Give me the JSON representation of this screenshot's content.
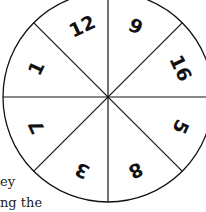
{
  "diagram": {
    "type": "spinner",
    "sections": 8,
    "center": [
      108,
      97
    ],
    "radius": 105,
    "line_color": "#111111",
    "labels": [
      {
        "id": "top-left",
        "text": "12",
        "x": 82,
        "y": 26,
        "rotate": -25
      },
      {
        "id": "top-right",
        "text": "9",
        "x": 136,
        "y": 26,
        "rotate": 25
      },
      {
        "id": "right-top",
        "text": "16",
        "x": 181,
        "y": 68,
        "rotate": 65
      },
      {
        "id": "right-bottom",
        "text": "5",
        "x": 181,
        "y": 127,
        "rotate": 115
      },
      {
        "id": "bottom-right",
        "text": "8",
        "x": 136,
        "y": 171,
        "rotate": 155
      },
      {
        "id": "bottom-left",
        "text": "3",
        "x": 82,
        "y": 171,
        "rotate": -155
      },
      {
        "id": "left-bottom",
        "text": "7",
        "x": 36,
        "y": 127,
        "rotate": -115
      },
      {
        "id": "left-top",
        "text": "1",
        "x": 36,
        "y": 68,
        "rotate": -65
      }
    ]
  },
  "caption": {
    "line1": "ey",
    "line2": "ng the"
  }
}
